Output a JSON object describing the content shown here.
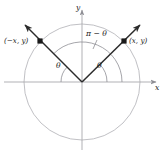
{
  "figure": {
    "colors": {
      "circle": "#b9b9bd",
      "axis": "#a8a8ad",
      "ray": "#2b2b2b",
      "arc": "#8e8e94",
      "label": "#1a1a1a",
      "background": "#ffffff"
    }
  },
  "axes": {
    "x_label": "x",
    "y_label": "y"
  },
  "points": [
    {
      "name": "left-point",
      "label": "(−x, y)",
      "x": 40,
      "y": 41
    },
    {
      "name": "right-point",
      "label": "(x, y)",
      "x": 124,
      "y": 41
    }
  ],
  "angles": [
    {
      "name": "theta-left",
      "label": "θ",
      "x": 60,
      "y": 66
    },
    {
      "name": "theta-right",
      "label": "θ",
      "x": 100,
      "y": 66
    },
    {
      "name": "pi-minus-theta",
      "label": "π − θ",
      "x": 91,
      "y": 34
    }
  ],
  "geometry": {
    "center_x": 82,
    "center_y": 82,
    "radius": 58
  }
}
